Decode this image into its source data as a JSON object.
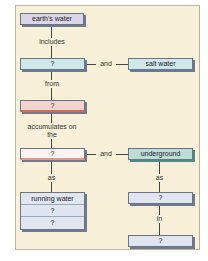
{
  "diagram": {
    "type": "concept map",
    "colors": {
      "panel_bg": "#f8f0d8",
      "lavender": "#dcd6ea",
      "cyan": "#cde8ea",
      "pink": "#f4d4cc",
      "light_pink": "#fbf3ef",
      "teal": "#bcdcd8",
      "blue": "#dfe6f2"
    },
    "nodes": {
      "earths_water": "earth's water",
      "fresh_water": "?",
      "salt_water": "salt water",
      "precipitation": "?",
      "surface": "?",
      "underground": "underground",
      "running_water": "running water",
      "surface_form_2": "?",
      "surface_form_3": "?",
      "groundwater": "?",
      "aquifers": "?"
    },
    "links": {
      "includes": "includes",
      "and_1": "and",
      "from": "from",
      "accumulates_on_the": "accumulates on the",
      "and_2": "and",
      "as_left": "as",
      "as_right": "as",
      "in": "in"
    }
  }
}
